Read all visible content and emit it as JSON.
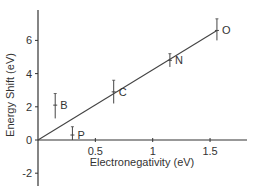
{
  "chart_data": {
    "type": "scatter",
    "title": "",
    "xlabel": "Electronegativity (eV)",
    "ylabel": "Energy Shift (eV)",
    "xlim": [
      0,
      1.8
    ],
    "ylim": [
      -2.7,
      7.9
    ],
    "xticks": [
      0.5,
      1,
      1.5
    ],
    "xtick_labels": [
      "0.5",
      "1",
      "1.5"
    ],
    "yticks": [
      -2,
      0,
      2,
      4,
      6
    ],
    "ytick_labels": [
      "-2",
      "0",
      "2",
      "4",
      "6"
    ],
    "grid": false,
    "legend": null,
    "points": [
      {
        "label": "B",
        "x": 0.15,
        "y": 2.1,
        "err_low": 1.3,
        "err_high": 2.8
      },
      {
        "label": "P",
        "x": 0.3,
        "y": 0.3,
        "err_low": 0.0,
        "err_high": 0.8
      },
      {
        "label": "C",
        "x": 0.66,
        "y": 2.9,
        "err_low": 2.2,
        "err_high": 3.6
      },
      {
        "label": "N",
        "x": 1.15,
        "y": 4.8,
        "err_low": 4.4,
        "err_high": 5.2
      },
      {
        "label": "O",
        "x": 1.56,
        "y": 6.6,
        "err_low": 6.0,
        "err_high": 7.3
      }
    ],
    "fit_line": {
      "x": [
        0,
        1.56
      ],
      "y": [
        0,
        6.6
      ]
    }
  },
  "colors": {
    "axis": "#333333",
    "line": "#444444",
    "text": "#333333"
  }
}
